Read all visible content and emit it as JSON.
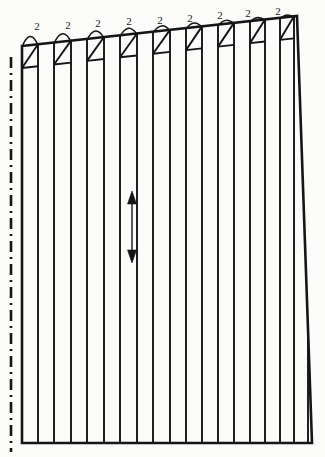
{
  "drawing": {
    "title": "Pleated Panel Pattern Piece",
    "type": "technical-pattern-drawing",
    "width": 325,
    "height": 457,
    "background_color": "#fbfbfa",
    "line_color": "#151515",
    "outline_stroke_width": 2.6,
    "pleat_stroke_width": 1.9,
    "fold_line_stroke_width": 2.6
  },
  "outline": {
    "name": "panel-outline",
    "description": "Quadrilateral panel with slanted top edge rising to the right and slanted right edge",
    "points": [
      {
        "x": 22,
        "y": 46
      },
      {
        "x": 297,
        "y": 16
      },
      {
        "x": 312,
        "y": 443
      },
      {
        "x": 22,
        "y": 443
      }
    ],
    "top_edge": {
      "x1": 22,
      "y1": 46,
      "x2": 297,
      "y2": 16
    },
    "right_edge": {
      "x1": 297,
      "y1": 16,
      "x2": 312,
      "y2": 443
    },
    "bottom_edge": {
      "x1": 22,
      "y1": 443,
      "x2": 312,
      "y2": 443
    },
    "left_edge": {
      "x1": 22,
      "y1": 46,
      "x2": 22,
      "y2": 443
    }
  },
  "fold_line": {
    "name": "center-fold-line",
    "style": "dash-dot",
    "x": 11,
    "y_top": 57,
    "y_bottom": 452,
    "dash_pattern": "11 5 2 5"
  },
  "pleat_lines": {
    "name": "pleat-fold-lines",
    "count": 18,
    "description": "Vertical pleat lines running full height of the panel",
    "x_positions": [
      38,
      54,
      71,
      87,
      104,
      120,
      137,
      153,
      170,
      186,
      202,
      218,
      234,
      250,
      265,
      280,
      294,
      308
    ],
    "y_bottom": 443
  },
  "pleat_marks": {
    "name": "pleat-symbols",
    "count": 9,
    "description": "Box-with-diagonal pleat symbols on top edge, each with an arc tick and quantity label",
    "label_text": "2",
    "box_width": 16,
    "box_height": 22,
    "items": [
      {
        "id": 1,
        "x_left": 22,
        "x_right": 38,
        "label_x": 37,
        "label_y": 26,
        "arc_y": 34
      },
      {
        "id": 2,
        "x_left": 54,
        "x_right": 71,
        "label_x": 68,
        "label_y": 25,
        "arc_y": 32
      },
      {
        "id": 3,
        "x_left": 87,
        "x_right": 104,
        "label_x": 98,
        "label_y": 23,
        "arc_y": 30
      },
      {
        "id": 4,
        "x_left": 120,
        "x_right": 137,
        "label_x": 129,
        "label_y": 21,
        "arc_y": 28
      },
      {
        "id": 5,
        "x_left": 153,
        "x_right": 170,
        "label_x": 160,
        "label_y": 20,
        "arc_y": 27
      },
      {
        "id": 6,
        "x_left": 186,
        "x_right": 202,
        "label_x": 190,
        "label_y": 18,
        "arc_y": 25
      },
      {
        "id": 7,
        "x_left": 218,
        "x_right": 234,
        "label_x": 220,
        "label_y": 15,
        "arc_y": 23
      },
      {
        "id": 8,
        "x_left": 250,
        "x_right": 265,
        "label_x": 248,
        "label_y": 13,
        "arc_y": 21
      },
      {
        "id": 9,
        "x_left": 280,
        "x_right": 294,
        "label_x": 278,
        "label_y": 11,
        "arc_y": 19
      }
    ]
  },
  "grainline": {
    "name": "grainline-arrow",
    "description": "Double-headed vertical arrow indicating fabric grain direction",
    "x": 132,
    "y_top": 191,
    "y_bottom": 263,
    "head_width": 9,
    "head_length": 13
  }
}
